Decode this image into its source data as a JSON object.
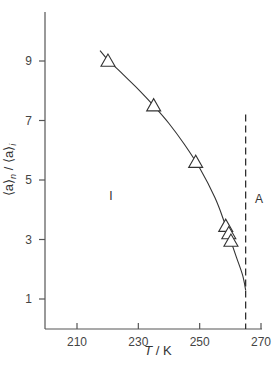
{
  "chart_data": {
    "type": "scatter",
    "title": "",
    "xlabel": "T / K",
    "ylabel": "⟨a⟩n / ⟨a⟩i",
    "xlim": [
      200,
      272
    ],
    "ylim": [
      0,
      10.3
    ],
    "x_ticks": [
      210,
      230,
      250,
      270
    ],
    "y_ticks": [
      1,
      3,
      5,
      7,
      9
    ],
    "grid": false,
    "legend": null,
    "series": [
      {
        "name": "data",
        "marker": "open-triangle",
        "x": [
          220.1,
          235.0,
          248.7,
          258.5,
          259.5,
          260.2
        ],
        "y": [
          9.0,
          7.5,
          5.6,
          3.45,
          3.2,
          2.95
        ]
      },
      {
        "name": "fit curve",
        "style": "solid-line",
        "x": [
          217.5,
          220,
          225,
          230,
          235,
          240,
          245,
          250,
          255,
          258,
          260,
          262,
          264,
          265
        ],
        "y": [
          9.35,
          9.05,
          8.55,
          8.05,
          7.5,
          6.9,
          6.2,
          5.4,
          4.4,
          3.6,
          3.0,
          2.4,
          1.8,
          1.3
        ]
      }
    ],
    "annotations": [
      {
        "type": "vline",
        "x": 265,
        "style": "dashed",
        "y_from": 0,
        "y_to": 7.2
      },
      {
        "type": "text",
        "text": "I",
        "x": 229,
        "y": 4.9
      },
      {
        "type": "text",
        "text": "A",
        "x": 269.5,
        "y": 5.7
      }
    ]
  },
  "labels": {
    "xlabel_T": "T",
    "xlabel_rest": " / K",
    "ylabel_main": "⟨a⟩",
    "ylabel_sub_n": "n",
    "ylabel_sep": " / ⟨a⟩",
    "ylabel_sub_i": "i",
    "region_I": "I",
    "region_A": "A"
  }
}
